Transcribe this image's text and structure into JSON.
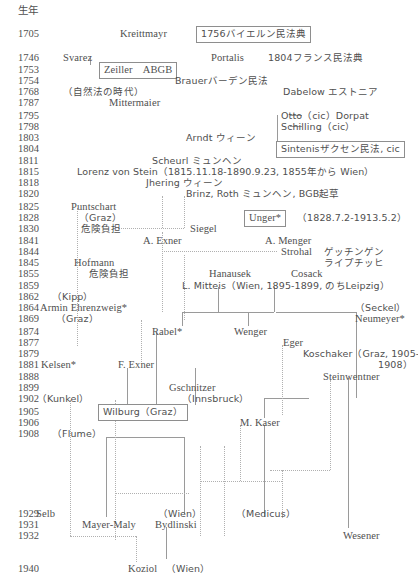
{
  "diagram": {
    "year_column_header": "生年",
    "years": [
      {
        "label": "1705",
        "top": 28
      },
      {
        "label": "1746",
        "top": 52
      },
      {
        "label": "1753",
        "top": 64
      },
      {
        "label": "1754",
        "top": 75
      },
      {
        "label": "1768",
        "top": 86
      },
      {
        "label": "1787",
        "top": 97
      },
      {
        "label": "1795",
        "top": 110
      },
      {
        "label": "1798",
        "top": 121
      },
      {
        "label": "1803",
        "top": 132
      },
      {
        "label": "1804",
        "top": 143
      },
      {
        "label": "1811",
        "top": 155
      },
      {
        "label": "1815",
        "top": 166
      },
      {
        "label": "1818",
        "top": 177
      },
      {
        "label": "1820",
        "top": 188
      },
      {
        "label": "1825",
        "top": 201
      },
      {
        "label": "1828",
        "top": 212
      },
      {
        "label": "1830",
        "top": 223
      },
      {
        "label": "1841",
        "top": 235
      },
      {
        "label": "1844",
        "top": 246
      },
      {
        "label": "1845",
        "top": 257
      },
      {
        "label": "1855",
        "top": 268
      },
      {
        "label": "1859",
        "top": 280
      },
      {
        "label": "1862",
        "top": 291
      },
      {
        "label": "1864",
        "top": 302
      },
      {
        "label": "1869",
        "top": 313
      },
      {
        "label": "1874",
        "top": 326
      },
      {
        "label": "1877",
        "top": 337
      },
      {
        "label": "1879",
        "top": 348
      },
      {
        "label": "1881",
        "top": 359
      },
      {
        "label": "1888",
        "top": 371
      },
      {
        "label": "1899",
        "top": 382
      },
      {
        "label": "1902",
        "top": 393
      },
      {
        "label": "1905",
        "top": 406
      },
      {
        "label": "1906",
        "top": 417
      },
      {
        "label": "1908",
        "top": 428
      },
      {
        "label": "1929",
        "top": 508
      },
      {
        "label": "1931",
        "top": 519
      },
      {
        "label": "1932",
        "top": 530
      },
      {
        "label": "1940",
        "top": 563
      }
    ],
    "nodes": [
      {
        "id": "kreittmayr",
        "text": "Kreittmayr",
        "left": 120,
        "top": 28,
        "boxed": false
      },
      {
        "id": "bayern-code",
        "text": "1756バイエルン民法典",
        "left": 196,
        "top": 26,
        "boxed": true,
        "jp": true
      },
      {
        "id": "svarez",
        "text": "Svarez",
        "left": 63,
        "top": 52,
        "boxed": false
      },
      {
        "id": "portalis",
        "text": "Portalis",
        "left": 211,
        "top": 52,
        "boxed": false
      },
      {
        "id": "france-code",
        "text": "1804フランス民法典",
        "left": 268,
        "top": 52,
        "boxed": false,
        "jp": true
      },
      {
        "id": "zeiller-abgb",
        "text": "Zeiller　ABGB",
        "left": 99,
        "top": 62,
        "boxed": true
      },
      {
        "id": "brauer",
        "text": "Brauerバーデン民法",
        "left": 175,
        "top": 75,
        "boxed": false,
        "jp": true
      },
      {
        "id": "natural-law-era",
        "text": "（自然法の時代）",
        "left": 63,
        "top": 86,
        "boxed": false,
        "jp": true
      },
      {
        "id": "dabelow",
        "text": "Dabelow エストニア",
        "left": 283,
        "top": 86,
        "boxed": false,
        "jp": true
      },
      {
        "id": "mittermaier",
        "text": "Mittermaier",
        "left": 109,
        "top": 97,
        "boxed": false
      },
      {
        "id": "otto",
        "text": "Otto（cic）Dorpat",
        "left": 281,
        "top": 110,
        "boxed": false,
        "jp": true
      },
      {
        "id": "schilling",
        "text": "Schilling（cic）",
        "left": 281,
        "top": 121,
        "boxed": false,
        "jp": true
      },
      {
        "id": "arndt",
        "text": "Arndt ウィーン",
        "left": 186,
        "top": 132,
        "boxed": false,
        "jp": true
      },
      {
        "id": "sintenis",
        "text": "Sintenisザクセン民法, cic",
        "left": 276,
        "top": 141,
        "boxed": true,
        "jp": true
      },
      {
        "id": "scheurl",
        "text": "Scheurl ミュンヘン",
        "left": 152,
        "top": 155,
        "boxed": false,
        "jp": true
      },
      {
        "id": "lorenz-von-stein",
        "text": "Lorenz von Stein（1815.11.18-1890.9.23, 1855年から Wien）",
        "left": 77,
        "top": 166,
        "boxed": false,
        "jp": true
      },
      {
        "id": "jhering",
        "text": "Jhering ウィーン",
        "left": 146,
        "top": 177,
        "boxed": false,
        "jp": true
      },
      {
        "id": "brinz-roth",
        "text": "Brinz, Roth ミュンヘン, BGB起草",
        "left": 186,
        "top": 188,
        "boxed": false,
        "jp": true
      },
      {
        "id": "puntschart",
        "text": "Puntschart",
        "left": 71,
        "top": 201,
        "boxed": false
      },
      {
        "id": "puntschart-graz",
        "text": "（Graz）",
        "left": 79,
        "top": 212,
        "boxed": false,
        "jp": true
      },
      {
        "id": "unger",
        "text": "Unger*",
        "left": 244,
        "top": 210,
        "boxed": true
      },
      {
        "id": "unger-dates",
        "text": "（1828.7.2-1913.5.2）",
        "left": 297,
        "top": 212,
        "boxed": false,
        "jp": true
      },
      {
        "id": "puntschart-risk",
        "text": "危険負担",
        "left": 81,
        "top": 223,
        "boxed": false,
        "jp": true
      },
      {
        "id": "siegel",
        "text": "Siegel",
        "left": 190,
        "top": 223,
        "boxed": false
      },
      {
        "id": "a-exner",
        "text": "A. Exner",
        "left": 143,
        "top": 235,
        "boxed": false
      },
      {
        "id": "a-menger",
        "text": "A. Menger",
        "left": 265,
        "top": 235,
        "boxed": false
      },
      {
        "id": "strohal",
        "text": "Strohal",
        "left": 281,
        "top": 246,
        "boxed": false
      },
      {
        "id": "goettingen",
        "text": "ゲッチンゲン",
        "left": 324,
        "top": 246,
        "boxed": false,
        "jp": true
      },
      {
        "id": "leipzig-kana",
        "text": "ライプチッヒ",
        "left": 324,
        "top": 257,
        "boxed": false,
        "jp": true
      },
      {
        "id": "hofmann",
        "text": "Hofmann",
        "left": 74,
        "top": 257,
        "boxed": false
      },
      {
        "id": "hanausek",
        "text": "Hanausek",
        "left": 209,
        "top": 268,
        "boxed": false
      },
      {
        "id": "cosack",
        "text": "Cosack",
        "left": 291,
        "top": 268,
        "boxed": false
      },
      {
        "id": "hofmann-risk",
        "text": "危険負担",
        "left": 89,
        "top": 268,
        "boxed": false,
        "jp": true
      },
      {
        "id": "l-mitteis",
        "text": "L. Mitteis（Wien, 1895-1899, のちLeipzig）",
        "left": 182,
        "top": 280,
        "boxed": false,
        "jp": true
      },
      {
        "id": "kipp",
        "text": "（Kipp）",
        "left": 52,
        "top": 291,
        "boxed": false,
        "jp": true
      },
      {
        "id": "armin-ehrenzweig",
        "text": "Armin Ehrenzweig*",
        "left": 40,
        "top": 302,
        "boxed": false
      },
      {
        "id": "seckel",
        "text": "（Seckel）",
        "left": 355,
        "top": 302,
        "boxed": false,
        "jp": true
      },
      {
        "id": "ehrenzweig-graz",
        "text": "（Graz）",
        "left": 56,
        "top": 313,
        "boxed": false,
        "jp": true
      },
      {
        "id": "neumeyer",
        "text": "Neumeyer*",
        "left": 355,
        "top": 313,
        "boxed": false
      },
      {
        "id": "rabel",
        "text": "Rabel*",
        "left": 152,
        "top": 326,
        "boxed": false
      },
      {
        "id": "wenger",
        "text": "Wenger",
        "left": 234,
        "top": 326,
        "boxed": false
      },
      {
        "id": "eger",
        "text": "Eger",
        "left": 283,
        "top": 337,
        "boxed": false
      },
      {
        "id": "koschaker",
        "text": "Koschaker（Graz, 1905-",
        "left": 303,
        "top": 348,
        "boxed": false,
        "jp": true
      },
      {
        "id": "koschaker-end",
        "text": "1908）",
        "left": 378,
        "top": 359,
        "boxed": false,
        "jp": true
      },
      {
        "id": "kelsen",
        "text": "Kelsen*",
        "left": 41,
        "top": 359,
        "boxed": false
      },
      {
        "id": "f-exner",
        "text": "F. Exner",
        "left": 118,
        "top": 359,
        "boxed": false
      },
      {
        "id": "steinwentner",
        "text": "Steinwentner",
        "left": 323,
        "top": 371,
        "boxed": false
      },
      {
        "id": "gschnitzer",
        "text": "Gschnitzer",
        "left": 169,
        "top": 382,
        "boxed": false
      },
      {
        "id": "kunkel",
        "text": "（Kunkel）",
        "left": 37,
        "top": 393,
        "boxed": false,
        "jp": true
      },
      {
        "id": "innsbruck",
        "text": "（Innsbruck）",
        "left": 182,
        "top": 393,
        "boxed": false,
        "jp": true
      },
      {
        "id": "wilburg",
        "text": "Wilburg（Graz）",
        "left": 98,
        "top": 404,
        "boxed": true,
        "jp": true
      },
      {
        "id": "m-kaser",
        "text": "M. Kaser",
        "left": 240,
        "top": 417,
        "boxed": false
      },
      {
        "id": "flume",
        "text": "（Flume）",
        "left": 52,
        "top": 428,
        "boxed": false,
        "jp": true
      },
      {
        "id": "selb",
        "text": "Selb",
        "left": 36,
        "top": 508,
        "boxed": false
      },
      {
        "id": "wien-bydlinski",
        "text": "（Wien）",
        "left": 158,
        "top": 508,
        "boxed": false,
        "jp": true
      },
      {
        "id": "medicus",
        "text": "（Medicus）",
        "left": 236,
        "top": 508,
        "boxed": false,
        "jp": true
      },
      {
        "id": "mayer-maly",
        "text": "Mayer-Maly",
        "left": 82,
        "top": 519,
        "boxed": false
      },
      {
        "id": "bydlinski",
        "text": "Bydlinski",
        "left": 155,
        "top": 519,
        "boxed": false
      },
      {
        "id": "wesener",
        "text": "Wesener",
        "left": 343,
        "top": 530,
        "boxed": false
      },
      {
        "id": "koziol",
        "text": "Koziol",
        "left": 128,
        "top": 563,
        "boxed": false
      },
      {
        "id": "koziol-wien",
        "text": "（Wien）",
        "left": 166,
        "top": 563,
        "boxed": false,
        "jp": true
      }
    ],
    "connector_solid_h": [
      {
        "left": 290,
        "top": 115,
        "width": 12
      },
      {
        "left": 290,
        "top": 126,
        "width": 12
      },
      {
        "left": 290,
        "top": 148,
        "width": 12
      },
      {
        "left": 182,
        "top": 312,
        "width": 92
      },
      {
        "left": 276,
        "top": 312,
        "width": 80
      },
      {
        "left": 264,
        "top": 398,
        "width": 45
      },
      {
        "left": 106,
        "top": 437,
        "width": 78
      }
    ],
    "connector_solid_v": [
      {
        "left": 277,
        "top": 115,
        "height": 33
      },
      {
        "left": 90,
        "top": 58,
        "height": 7
      },
      {
        "left": 218,
        "top": 287,
        "height": 25
      },
      {
        "left": 274,
        "top": 287,
        "height": 25
      },
      {
        "left": 182,
        "top": 312,
        "height": 14
      },
      {
        "left": 248,
        "top": 312,
        "height": 14
      },
      {
        "left": 356,
        "top": 312,
        "height": 86
      },
      {
        "left": 156,
        "top": 333,
        "height": 72
      },
      {
        "left": 127,
        "top": 368,
        "height": 37
      },
      {
        "left": 195,
        "top": 368,
        "height": 37
      },
      {
        "left": 348,
        "top": 378,
        "height": 20
      },
      {
        "left": 264,
        "top": 398,
        "height": 20
      },
      {
        "left": 106,
        "top": 437,
        "height": 80
      },
      {
        "left": 184,
        "top": 437,
        "height": 77
      },
      {
        "left": 264,
        "top": 425,
        "height": 92
      },
      {
        "left": 348,
        "top": 398,
        "height": 130
      },
      {
        "left": 166,
        "top": 527,
        "height": 32
      }
    ],
    "connector_dotted_h": [
      {
        "left": 118,
        "top": 228,
        "width": 66
      },
      {
        "left": 162,
        "top": 251,
        "width": 115
      },
      {
        "left": 200,
        "top": 481,
        "width": 82
      },
      {
        "left": 115,
        "top": 493,
        "width": 74
      },
      {
        "left": 270,
        "top": 470,
        "width": 60
      },
      {
        "left": 70,
        "top": 536,
        "width": 66
      }
    ],
    "connector_dotted_v": [
      {
        "left": 162,
        "top": 196,
        "height": 32
      },
      {
        "left": 184,
        "top": 196,
        "height": 32
      },
      {
        "left": 77,
        "top": 208,
        "height": 138
      },
      {
        "left": 162,
        "top": 232,
        "height": 80
      },
      {
        "left": 184,
        "top": 255,
        "height": 65
      },
      {
        "left": 141,
        "top": 320,
        "height": 42
      },
      {
        "left": 282,
        "top": 345,
        "height": 70
      },
      {
        "left": 330,
        "top": 380,
        "height": 90
      },
      {
        "left": 240,
        "top": 425,
        "height": 56
      },
      {
        "left": 282,
        "top": 470,
        "height": 48
      },
      {
        "left": 200,
        "top": 446,
        "height": 90
      },
      {
        "left": 224,
        "top": 446,
        "height": 90
      },
      {
        "left": 115,
        "top": 400,
        "height": 140
      },
      {
        "left": 70,
        "top": 400,
        "height": 136
      },
      {
        "left": 136,
        "top": 536,
        "height": 26
      }
    ]
  }
}
